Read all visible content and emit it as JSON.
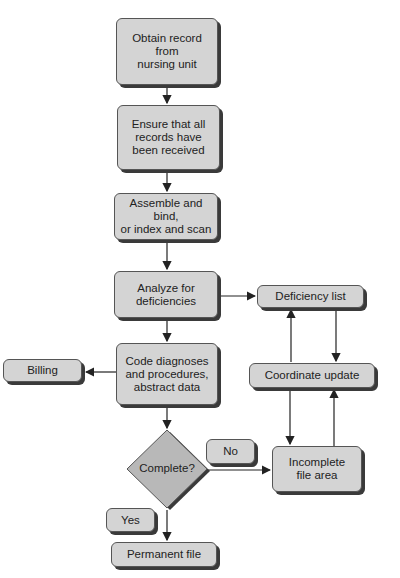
{
  "diagram": {
    "type": "flowchart",
    "nodes": {
      "obtain": "Obtain record\nfrom\nnursing unit",
      "ensure": "Ensure that all\nrecords have\nbeen received",
      "assemble": "Assemble and bind,\nor index and scan",
      "analyze": "Analyze for\ndeficiencies",
      "deficiency_list": "Deficiency list",
      "code": "Code diagnoses\nand procedures,\nabstract data",
      "billing": "Billing",
      "coordinate": "Coordinate update",
      "complete": "Complete?",
      "no": "No",
      "incomplete": "Incomplete\nfile area",
      "yes": "Yes",
      "permanent": "Permanent file"
    },
    "edges": [
      {
        "from": "obtain",
        "to": "ensure"
      },
      {
        "from": "ensure",
        "to": "assemble"
      },
      {
        "from": "assemble",
        "to": "analyze"
      },
      {
        "from": "analyze",
        "to": "deficiency_list"
      },
      {
        "from": "analyze",
        "to": "code"
      },
      {
        "from": "deficiency_list",
        "to": "coordinate"
      },
      {
        "from": "coordinate",
        "to": "deficiency_list"
      },
      {
        "from": "coordinate",
        "to": "incomplete"
      },
      {
        "from": "incomplete",
        "to": "coordinate"
      },
      {
        "from": "code",
        "to": "billing"
      },
      {
        "from": "code",
        "to": "complete"
      },
      {
        "from": "complete",
        "to": "incomplete",
        "label": "No"
      },
      {
        "from": "complete",
        "to": "permanent",
        "label": "Yes"
      }
    ],
    "colors": {
      "node_fill": "#d4d4d4",
      "node_border": "#555555",
      "shadow": "#3a3a3a",
      "diamond_fill": "#b8b8b8",
      "line": "#222222"
    }
  }
}
